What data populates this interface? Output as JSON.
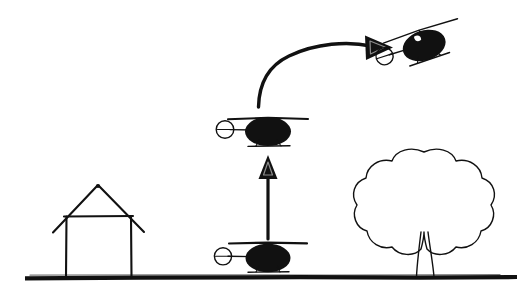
{
  "canvas": {
    "width": 532,
    "height": 294,
    "background_color": "#ffffff",
    "ink_color": "#111111",
    "style": "hand-drawn black ink line sketch"
  },
  "diagram": {
    "kind": "line-sketch-illustration"
  },
  "ground": {
    "label": "ground-line",
    "x_start": 25,
    "x_end": 517,
    "y": 277,
    "thickness": 4.2,
    "color": "#111111"
  },
  "house": {
    "label": "house",
    "wall_left_x": 66,
    "wall_right_x": 131,
    "wall_top_y": 216,
    "wall_bottom_y": 277,
    "roof_apex_x": 98,
    "roof_apex_y": 185,
    "roof_left_eave_x": 53,
    "roof_right_eave_x": 144,
    "roof_eave_y": 232
  },
  "tree": {
    "label": "tree",
    "canopy_center_x": 425,
    "canopy_center_y": 198,
    "canopy_radius_x": 62,
    "canopy_radius_y": 48,
    "trunk_left_x": 418,
    "trunk_right_x": 434,
    "trunk_top_y": 228,
    "trunk_bottom_y": 277,
    "canopy_lobes": 9
  },
  "helicopters": [
    {
      "id": "helicopter-grounded",
      "state_label": "landed",
      "body_center_x": 268,
      "body_center_y": 258,
      "body_radius_x": 22,
      "body_radius_y": 14,
      "rotor_y": 243,
      "rotor_left_x": 229,
      "rotor_right_x": 307,
      "mast_top_y": 243,
      "mast_bottom_y": 250,
      "tail_boom_left_x": 228,
      "tail_boom_y": 256,
      "tail_rotor_cx": 223,
      "tail_rotor_cy": 256,
      "tail_rotor_r": 9,
      "skid_y": 272,
      "skid_left_x": 250,
      "skid_right_x": 288,
      "rotation_deg": 0
    },
    {
      "id": "helicopter-hovering",
      "state_label": "hovering after vertical climb",
      "body_center_x": 268,
      "body_center_y": 131,
      "body_radius_x": 23,
      "body_radius_y": 14,
      "rotor_y": 118,
      "rotor_left_x": 228,
      "rotor_right_x": 308,
      "mast_top_y": 118,
      "mast_bottom_y": 124,
      "tail_boom_left_x": 231,
      "tail_boom_y": 129,
      "tail_rotor_cx": 225,
      "tail_rotor_cy": 129,
      "tail_rotor_r": 9,
      "skid_y": 146,
      "skid_left_x": 249,
      "skid_right_x": 289,
      "rotation_deg": 0
    },
    {
      "id": "helicopter-forward-flight",
      "state_label": "nose-down forward flight",
      "body_center_x": 424,
      "body_center_y": 45,
      "body_radius_x": 22,
      "body_radius_y": 15,
      "rotor_y": 30,
      "rotor_left_x": 386,
      "rotor_right_x": 466,
      "mast_top_y": 30,
      "mast_bottom_y": 37,
      "tail_boom_left_x": 388,
      "tail_boom_y": 43,
      "tail_rotor_cx": 385,
      "tail_rotor_cy": 41,
      "tail_rotor_r": 9,
      "skid_y": 60,
      "skid_left_x": 405,
      "skid_right_x": 445,
      "rotation_deg": -18
    }
  ],
  "arrows": [
    {
      "id": "arrow-vertical-climb",
      "label": "vertical ascent arrow",
      "direction": "up",
      "shaft_x": 268,
      "shaft_bottom_y": 238,
      "shaft_top_y": 168,
      "head_tip_x": 268,
      "head_tip_y": 155,
      "head_half_width": 9,
      "head_base_y": 177,
      "thickness": 3.2
    },
    {
      "id": "arrow-forward-transition",
      "label": "curved forward-flight arrow",
      "direction": "up-right-curve",
      "tail_x": 258,
      "tail_y": 107,
      "control1_x": 268,
      "control1_y": 62,
      "control2_x": 318,
      "control2_y": 42,
      "head_tip_x": 392,
      "head_tip_y": 47,
      "head_back_x": 367,
      "head_half_width": 13,
      "thickness": 3.4
    }
  ]
}
